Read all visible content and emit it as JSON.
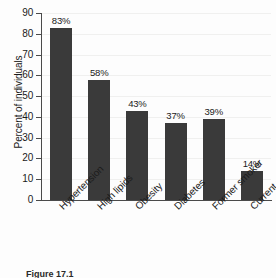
{
  "chart_data": {
    "type": "bar",
    "title": "",
    "subtitle": "",
    "xlabel": "",
    "ylabel": "Percent of individuals",
    "ylim": [
      0,
      90
    ],
    "ytick_step": 10,
    "yticks": [
      90,
      80,
      70,
      60,
      50,
      40,
      30,
      20,
      10,
      0
    ],
    "grid": true,
    "grid_axis": "y",
    "legend": false,
    "legend_position": "none",
    "orientation": "vertical",
    "bar_color": "#3a3a3a",
    "background_color": "#fdfdfd",
    "axis_color": "#4a4a4a",
    "gridline_color": "#f0f0ef",
    "value_label_suffix": "%",
    "xtick_label_rotation": -45,
    "categories": [
      "Hypertension",
      "High lipids",
      "Obesity",
      "Diabetes",
      "Former smoker",
      "Current smoker"
    ],
    "values": [
      83,
      58,
      43,
      37,
      39,
      14
    ],
    "value_labels": [
      "83%",
      "58%",
      "43%",
      "37%",
      "39%",
      "14%"
    ]
  },
  "caption": {
    "figure_number": "Figure 17.1",
    "text": "Figure 17.1"
  }
}
